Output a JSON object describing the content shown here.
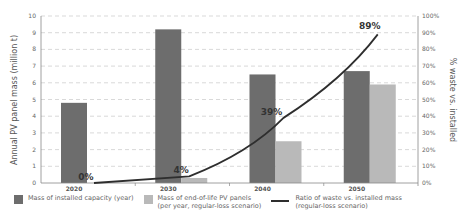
{
  "chart_data": {
    "type": "bar",
    "title": "",
    "categories": [
      "2020",
      "2030",
      "2040",
      "2050"
    ],
    "series": [
      {
        "name": "Mass of installed capacity (year)",
        "type": "bar",
        "axis": "left",
        "color": "#6d6d6d",
        "values": [
          4.8,
          9.2,
          6.5,
          6.7
        ]
      },
      {
        "name": "Mass of end-of-life PV panels (per year, regular-loss scenario)",
        "type": "bar",
        "axis": "left",
        "color": "#b9b9b9",
        "values": [
          0.0,
          0.3,
          2.5,
          5.9
        ]
      },
      {
        "name": "Ratio of waste vs. installed mass (regular-loss scenario)",
        "type": "line",
        "axis": "right",
        "color": "#2e2e2e",
        "values": [
          0,
          4,
          39,
          89
        ],
        "labels": [
          "0%",
          "4%",
          "39%",
          "89%"
        ]
      }
    ],
    "xlabel": "",
    "ylabel": "Annual PV panel mass (million t)",
    "y2label": "% waste vs. installed",
    "ylim": [
      0,
      10
    ],
    "y2lim": [
      0,
      100
    ],
    "yticks": [
      "0",
      "1",
      "2",
      "3",
      "4",
      "5",
      "6",
      "7",
      "8",
      "9",
      "10"
    ],
    "y2ticks": [
      "0%",
      "10%",
      "20%",
      "30%",
      "40%",
      "50%",
      "60%",
      "70%",
      "80%",
      "90%",
      "100%"
    ],
    "grid": "horizontal dashed",
    "legend_position": "bottom"
  },
  "legend": {
    "installed": "Mass of installed capacity (year)",
    "eol": "Mass of end-of-life PV panels\n(per year, regular-loss scenario)",
    "ratio": "Ratio of waste vs. installed mass\n(regular-loss scenario)"
  },
  "colors": {
    "installed": "#6d6d6d",
    "eol": "#b9b9b9",
    "line": "#2e2e2e",
    "grid": "#c8c8c8"
  }
}
